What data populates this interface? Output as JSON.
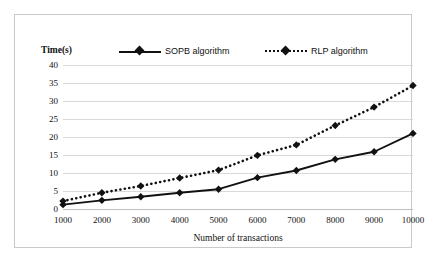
{
  "chart_data": {
    "type": "line",
    "title": "",
    "xlabel": "Number of transactions",
    "ylabel": "Time(s)",
    "categories": [
      1000,
      2000,
      3000,
      4000,
      5000,
      6000,
      7000,
      8000,
      9000,
      10000
    ],
    "x_tick_labels": [
      "1000",
      "2000",
      "3000",
      "4000",
      "5000",
      "6000",
      "7000",
      "8000",
      "9000",
      "10000"
    ],
    "y_tick_labels": [
      "0",
      "5",
      "10",
      "15",
      "20",
      "25",
      "30",
      "35",
      "40"
    ],
    "y_ticks": [
      0,
      5,
      10,
      15,
      20,
      25,
      30,
      35,
      40
    ],
    "ylim": [
      0,
      40
    ],
    "xlim": [
      1000,
      10000
    ],
    "grid": "horizontal",
    "legend_position": "top",
    "series": [
      {
        "name": "SOPB algorithm",
        "style": "solid",
        "marker": "diamond",
        "color": "#111111",
        "values": [
          1.2,
          2.4,
          3.4,
          4.5,
          5.5,
          8.7,
          10.7,
          13.8,
          15.9,
          21.0
        ]
      },
      {
        "name": "RLP algorithm",
        "style": "dotted",
        "marker": "diamond",
        "color": "#111111",
        "values": [
          2.2,
          4.5,
          6.4,
          8.6,
          10.8,
          14.9,
          17.8,
          23.2,
          28.3,
          34.3
        ]
      }
    ]
  },
  "figure": {
    "background_color": "#ffffff",
    "border_color": "#c9c9c9",
    "gridline_color": "#d9d9d9"
  }
}
